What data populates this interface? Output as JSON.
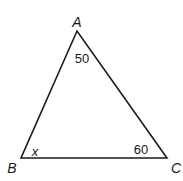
{
  "diagram": {
    "type": "triangle",
    "stroke_color": "#1a1a1a",
    "background": "#ffffff",
    "vertices": [
      {
        "name": "A",
        "x": 77,
        "y": 31,
        "label_x": 77,
        "label_y": 27
      },
      {
        "name": "B",
        "x": 21,
        "y": 158,
        "label_x": 12,
        "label_y": 173
      },
      {
        "name": "C",
        "x": 167,
        "y": 158,
        "label_x": 176,
        "label_y": 173
      }
    ],
    "angles": [
      {
        "vertex": "A",
        "label": "50",
        "x": 82,
        "y": 63
      },
      {
        "vertex": "B",
        "label": "x",
        "x": 35,
        "y": 156
      },
      {
        "vertex": "C",
        "label": "60",
        "x": 141,
        "y": 154
      }
    ]
  }
}
